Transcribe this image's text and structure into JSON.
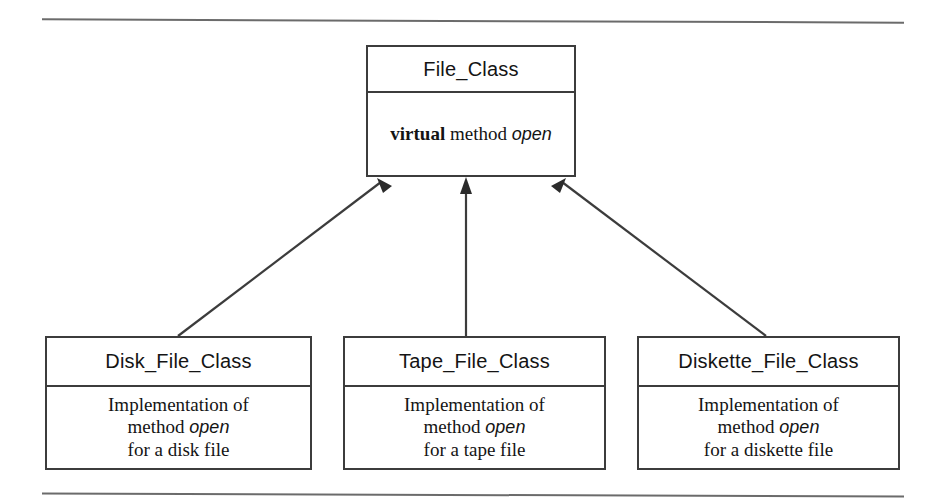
{
  "figure": {
    "background_color": "#ffffff",
    "line_color": "#3c3c3c",
    "rule_color": "#6b6b6b"
  },
  "parent_class": {
    "name": "File_Class",
    "body": {
      "keyword": "virtual",
      "middle": "method",
      "member": "open"
    }
  },
  "child_classes": [
    {
      "name": "Disk_File_Class",
      "body_lines": [
        "Implementation of",
        "method open",
        "for a disk file"
      ],
      "body": {
        "line1": "Implementation of",
        "line2_prefix": "method",
        "line2_member": "open",
        "line3": "for a disk file"
      }
    },
    {
      "name": "Tape_File_Class",
      "body_lines": [
        "Implementation of",
        "method open",
        "for a tape file"
      ],
      "body": {
        "line1": "Implementation of",
        "line2_prefix": "method",
        "line2_member": "open",
        "line3": "for a tape file"
      }
    },
    {
      "name": "Diskette_File_Class",
      "body_lines": [
        "Implementation of",
        "method open",
        "for a diskette file"
      ],
      "body": {
        "line1": "Implementation of",
        "line2_prefix": "method",
        "line2_member": "open",
        "line3": "for a diskette file"
      }
    }
  ],
  "connectors": [
    {
      "from": "Disk_File_Class",
      "to": "File_Class",
      "style": "open-arrow",
      "shape": "diagonal"
    },
    {
      "from": "Tape_File_Class",
      "to": "File_Class",
      "style": "open-arrow",
      "shape": "vertical"
    },
    {
      "from": "Diskette_File_Class",
      "to": "File_Class",
      "style": "open-arrow",
      "shape": "diagonal"
    }
  ]
}
